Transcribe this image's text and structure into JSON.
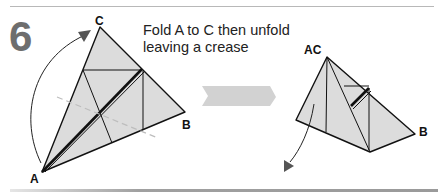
{
  "header": {
    "remnant_text": "Fish"
  },
  "step": {
    "number": "6",
    "instruction_line1": "Fold A to C then unfold",
    "instruction_line2": "leaving a crease"
  },
  "left_diagram": {
    "labels": {
      "a": "A",
      "b": "B",
      "c": "C"
    }
  },
  "right_diagram": {
    "labels": {
      "ac": "AC",
      "b": "B"
    }
  },
  "colors": {
    "paper": "#dcdcdc",
    "line": "#111111",
    "step_number": "#6e6e6e",
    "arrow_gray": "#d2d2d2",
    "dashed_crease": "#bdbdbd"
  }
}
